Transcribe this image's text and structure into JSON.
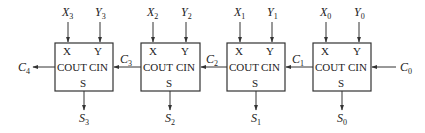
{
  "diagram": {
    "colors": {
      "stroke": "#333333",
      "text": "#222222",
      "background": "#ffffff"
    },
    "adders": [
      {
        "id": "FA3",
        "x": 55,
        "in_x": "X",
        "in_x_sub": "3",
        "in_y": "Y",
        "in_y_sub": "3",
        "out_s": "S",
        "out_s_sub": "3",
        "port_x": "X",
        "port_y": "Y",
        "port_cout": "COUT",
        "port_cin": "CIN",
        "port_s": "S"
      },
      {
        "id": "FA2",
        "x": 141,
        "in_x": "X",
        "in_x_sub": "2",
        "in_y": "Y",
        "in_y_sub": "2",
        "out_s": "S",
        "out_s_sub": "2",
        "port_x": "X",
        "port_y": "Y",
        "port_cout": "COUT",
        "port_cin": "CIN",
        "port_s": "S"
      },
      {
        "id": "FA1",
        "x": 227,
        "in_x": "X",
        "in_x_sub": "1",
        "in_y": "Y",
        "in_y_sub": "1",
        "out_s": "S",
        "out_s_sub": "1",
        "port_x": "X",
        "port_y": "Y",
        "port_cout": "COUT",
        "port_cin": "CIN",
        "port_s": "S"
      },
      {
        "id": "FA0",
        "x": 313,
        "in_x": "X",
        "in_x_sub": "0",
        "in_y": "Y",
        "in_y_sub": "0",
        "out_s": "S",
        "out_s_sub": "0",
        "port_x": "X",
        "port_y": "Y",
        "port_cout": "COUT",
        "port_cin": "CIN",
        "port_s": "S"
      }
    ],
    "carries": [
      {
        "label": "C",
        "sub": "4"
      },
      {
        "label": "C",
        "sub": "3"
      },
      {
        "label": "C",
        "sub": "2"
      },
      {
        "label": "C",
        "sub": "1"
      },
      {
        "label": "C",
        "sub": "0"
      }
    ]
  }
}
